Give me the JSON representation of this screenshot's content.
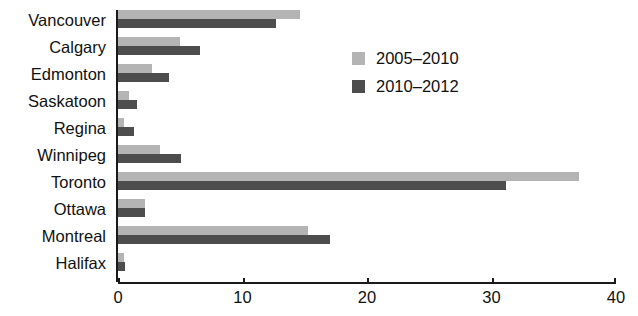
{
  "chart_data": {
    "type": "bar",
    "orientation": "horizontal",
    "title": "",
    "xlabel": "",
    "ylabel": "",
    "xlim": [
      0,
      40
    ],
    "xticks": [
      0,
      10,
      20,
      30,
      40
    ],
    "xtick_labels": [
      "0",
      "10",
      "20",
      "30",
      "40"
    ],
    "grid": false,
    "legend_position": "upper-center-right",
    "categories": [
      "Vancouver",
      "Calgary",
      "Edmonton",
      "Saskatoon",
      "Regina",
      "Winnipeg",
      "Toronto",
      "Ottawa",
      "Montreal",
      "Halifax"
    ],
    "series": [
      {
        "name": "2005–2010",
        "color": "#b4b4b4",
        "values": [
          14.6,
          5.0,
          2.7,
          0.9,
          0.5,
          3.4,
          37.0,
          2.2,
          15.3,
          0.5
        ]
      },
      {
        "name": "2010–2012",
        "color": "#4d4d4d",
        "values": [
          12.7,
          6.6,
          4.1,
          1.5,
          1.3,
          5.1,
          31.2,
          2.2,
          17.0,
          0.6
        ]
      }
    ]
  },
  "legend": {
    "items": [
      {
        "label": "2005–2010",
        "swatch": "s0"
      },
      {
        "label": "2010–2012",
        "swatch": "s1"
      }
    ]
  },
  "colors": {
    "series_2005_2010": "#b4b4b4",
    "series_2010_2012": "#4d4d4d",
    "axis": "#1a1a1a",
    "background": "#ffffff",
    "text": "#111111"
  }
}
